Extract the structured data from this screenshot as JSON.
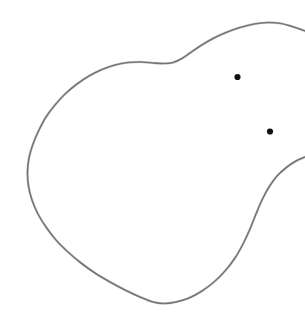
{
  "figure": {
    "background_color": "#ffffff",
    "width": 305,
    "height": 314
  },
  "chart_data": {
    "type": "scatter",
    "title": "",
    "subtitle": "",
    "xlabel": "",
    "ylabel": "",
    "xlim": [
      0,
      305
    ],
    "ylim": [
      0,
      314
    ],
    "grid": false,
    "legend": "none",
    "axes_visible": false,
    "tick_labels_x": [],
    "tick_labels_y": [],
    "annotations": [],
    "series": [
      {
        "name": "interior points",
        "marker": "filled-circle",
        "color": "#111111",
        "radius_px": 3.1,
        "points": [
          {
            "label": "point-1",
            "x": 237.5,
            "y": 77.0
          },
          {
            "label": "point-2",
            "x": 270.0,
            "y": 131.5
          }
        ]
      },
      {
        "name": "closed curve outline",
        "marker": "none",
        "stroke_color": "#757575",
        "stroke_width_px": 1.6,
        "closed": true,
        "description": "irregular hand-drawn peanut / kidney-bean shaped closed loop clipped at the right edge of the frame",
        "path_points": [
          {
            "x": 305.0,
            "y": 31.0
          },
          {
            "x": 292.0,
            "y": 26.5
          },
          {
            "x": 281.0,
            "y": 23.5
          },
          {
            "x": 268.0,
            "y": 22.5
          },
          {
            "x": 254.0,
            "y": 24.0
          },
          {
            "x": 240.0,
            "y": 27.5
          },
          {
            "x": 226.0,
            "y": 32.5
          },
          {
            "x": 213.0,
            "y": 38.5
          },
          {
            "x": 201.0,
            "y": 45.5
          },
          {
            "x": 190.0,
            "y": 53.0
          },
          {
            "x": 181.0,
            "y": 59.0
          },
          {
            "x": 173.0,
            "y": 62.5
          },
          {
            "x": 164.0,
            "y": 63.5
          },
          {
            "x": 153.0,
            "y": 63.0
          },
          {
            "x": 141.0,
            "y": 62.0
          },
          {
            "x": 128.0,
            "y": 62.5
          },
          {
            "x": 115.0,
            "y": 65.0
          },
          {
            "x": 102.0,
            "y": 69.5
          },
          {
            "x": 89.0,
            "y": 76.0
          },
          {
            "x": 77.0,
            "y": 84.0
          },
          {
            "x": 65.0,
            "y": 94.0
          },
          {
            "x": 55.0,
            "y": 105.0
          },
          {
            "x": 46.0,
            "y": 117.0
          },
          {
            "x": 39.0,
            "y": 130.0
          },
          {
            "x": 33.0,
            "y": 144.0
          },
          {
            "x": 29.0,
            "y": 158.0
          },
          {
            "x": 27.5,
            "y": 172.0
          },
          {
            "x": 28.5,
            "y": 186.0
          },
          {
            "x": 32.0,
            "y": 200.0
          },
          {
            "x": 38.0,
            "y": 214.0
          },
          {
            "x": 46.0,
            "y": 227.0
          },
          {
            "x": 56.0,
            "y": 240.0
          },
          {
            "x": 68.0,
            "y": 252.0
          },
          {
            "x": 81.0,
            "y": 263.0
          },
          {
            "x": 95.0,
            "y": 273.0
          },
          {
            "x": 110.0,
            "y": 282.0
          },
          {
            "x": 125.0,
            "y": 290.0
          },
          {
            "x": 140.0,
            "y": 297.0
          },
          {
            "x": 153.0,
            "y": 302.0
          },
          {
            "x": 164.0,
            "y": 303.5
          },
          {
            "x": 176.0,
            "y": 302.0
          },
          {
            "x": 189.0,
            "y": 298.0
          },
          {
            "x": 202.0,
            "y": 291.0
          },
          {
            "x": 214.0,
            "y": 282.0
          },
          {
            "x": 225.0,
            "y": 271.0
          },
          {
            "x": 235.0,
            "y": 258.0
          },
          {
            "x": 243.0,
            "y": 244.0
          },
          {
            "x": 250.0,
            "y": 229.0
          },
          {
            "x": 256.0,
            "y": 214.0
          },
          {
            "x": 262.0,
            "y": 200.0
          },
          {
            "x": 269.0,
            "y": 187.0
          },
          {
            "x": 277.0,
            "y": 176.0
          },
          {
            "x": 287.0,
            "y": 167.0
          },
          {
            "x": 296.0,
            "y": 161.0
          },
          {
            "x": 305.0,
            "y": 157.0
          }
        ]
      }
    ]
  }
}
